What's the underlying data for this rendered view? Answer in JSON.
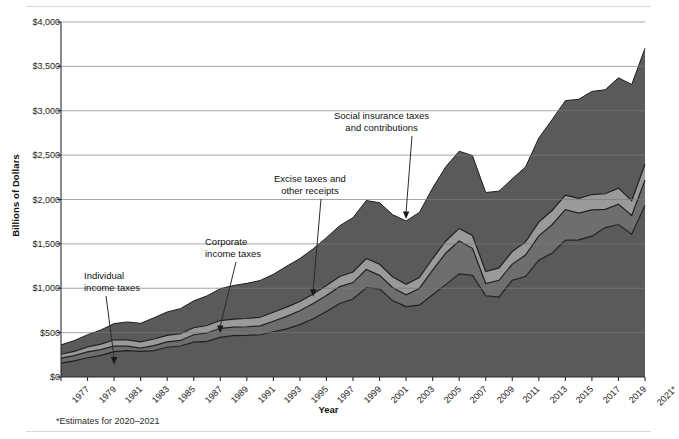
{
  "chart_data": {
    "type": "area",
    "title": "",
    "subtitle": "",
    "xlabel": "Year",
    "ylabel": "Billions of Dollars",
    "ylim": [
      0,
      4000
    ],
    "ytick_values": [
      0,
      500,
      1000,
      1500,
      2000,
      2500,
      3000,
      3500,
      4000
    ],
    "ytick_labels": [
      "$0",
      "$500",
      "$1,000",
      "$1,500",
      "$2,000",
      "$2,500",
      "$3,000",
      "$3,500",
      "$4,000"
    ],
    "grid": true,
    "stacked": true,
    "legend_position": "annotations-inline",
    "x": [
      1977,
      1978,
      1979,
      1980,
      1981,
      1982,
      1983,
      1984,
      1985,
      1986,
      1987,
      1988,
      1989,
      1990,
      1991,
      1992,
      1993,
      1994,
      1995,
      1996,
      1997,
      1998,
      1999,
      2000,
      2001,
      2002,
      2003,
      2004,
      2005,
      2006,
      2007,
      2008,
      2009,
      2010,
      2011,
      2012,
      2013,
      2014,
      2015,
      2016,
      2017,
      2018,
      2019,
      2020,
      2021
    ],
    "xtick_labels": [
      "1977",
      "1979",
      "1981",
      "1983",
      "1985",
      "1987",
      "1989",
      "1991",
      "1993",
      "1995",
      "1997",
      "1999",
      "2001",
      "2003",
      "2005",
      "2007",
      "2009",
      "2011",
      "2013",
      "2015",
      "2017",
      "2019",
      "2021*"
    ],
    "xtick_values": [
      1977,
      1979,
      1981,
      1983,
      1985,
      1987,
      1989,
      1991,
      1993,
      1995,
      1997,
      1999,
      2001,
      2003,
      2005,
      2007,
      2009,
      2011,
      2013,
      2015,
      2017,
      2019,
      2021
    ],
    "series": [
      {
        "name": "Individual income taxes",
        "color": "#5a5a5a",
        "values": [
          157,
          181,
          217,
          244,
          286,
          298,
          289,
          298,
          335,
          349,
          392,
          401,
          446,
          467,
          468,
          476,
          510,
          543,
          590,
          656,
          737,
          829,
          879,
          1004,
          994,
          858,
          794,
          809,
          927,
          1044,
          1163,
          1146,
          915,
          899,
          1091,
          1132,
          1316,
          1395,
          1541,
          1546,
          1587,
          1684,
          1718,
          1609,
          1932
        ]
      },
      {
        "name": "Corporate income taxes",
        "color": "#6e6e6e",
        "values": [
          55,
          60,
          66,
          65,
          61,
          49,
          37,
          56,
          61,
          63,
          84,
          95,
          103,
          94,
          98,
          100,
          118,
          140,
          157,
          172,
          182,
          189,
          185,
          207,
          151,
          148,
          132,
          189,
          278,
          354,
          370,
          304,
          138,
          191,
          181,
          242,
          274,
          321,
          344,
          300,
          297,
          205,
          230,
          212,
          284
        ]
      },
      {
        "name": "Excise taxes and other receipts",
        "color": "#9a9a9a",
        "values": [
          44,
          48,
          55,
          62,
          73,
          72,
          70,
          74,
          72,
          75,
          79,
          84,
          87,
          90,
          93,
          97,
          101,
          104,
          104,
          107,
          112,
          115,
          119,
          124,
          125,
          121,
          119,
          123,
          130,
          135,
          141,
          145,
          135,
          139,
          142,
          148,
          155,
          160,
          164,
          168,
          172,
          176,
          180,
          165,
          181
        ]
      },
      {
        "name": "Social insurance taxes and contributions",
        "color": "#5a5a5a",
        "values": [
          106,
          121,
          138,
          158,
          182,
          201,
          209,
          239,
          265,
          283,
          303,
          334,
          359,
          380,
          396,
          414,
          428,
          461,
          484,
          509,
          539,
          572,
          612,
          653,
          694,
          701,
          713,
          733,
          794,
          838,
          870,
          900,
          891,
          865,
          819,
          845,
          948,
          1024,
          1065,
          1115,
          1162,
          1171,
          1243,
          1310,
          1307
        ]
      }
    ],
    "annotations": [
      {
        "id": "individual-income-taxes",
        "text_lines": [
          "Individual",
          "income taxes"
        ],
        "target_year": 1981,
        "target_value": 140
      },
      {
        "id": "corporate-income-taxes",
        "text_lines": [
          "Corporate",
          "income taxes"
        ],
        "target_year": 1989,
        "target_value": 495
      },
      {
        "id": "excise-taxes-other-receipts",
        "text_lines": [
          "Excise taxes and",
          "other receipts"
        ],
        "target_year": 1996,
        "target_value": 905
      },
      {
        "id": "social-insurance-taxes",
        "text_lines": [
          "Social insurance taxes",
          "and contributions"
        ],
        "target_year": 2003,
        "target_value": 1780
      }
    ],
    "footnote": "*Estimates for 2020–2021"
  },
  "axes": {
    "y_title": "Billions of Dollars",
    "x_title": "Year"
  },
  "colors": {
    "band_dark": "#5a5a5a",
    "band_mid": "#6e6e6e",
    "band_light": "#9a9a9a",
    "grid": "#7c7c7c",
    "axis": "#2b2b2b",
    "rule": "#d8d8d8",
    "background": "#ffffff"
  }
}
